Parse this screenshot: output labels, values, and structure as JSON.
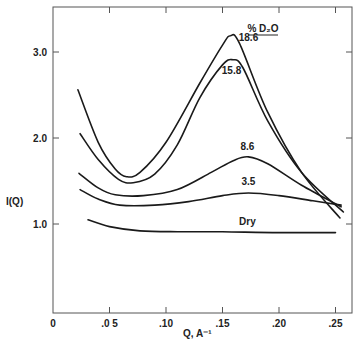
{
  "chart_data": {
    "type": "line",
    "title": "",
    "xlabel": "Q, A⁻¹",
    "ylabel": "I(Q)",
    "xlim": [
      0,
      0.265
    ],
    "ylim": [
      0,
      3.5
    ],
    "grid": false,
    "x_ticks": [
      {
        "value": 0,
        "label": "0"
      },
      {
        "value": 0.05,
        "label": ".0 5"
      },
      {
        "value": 0.1,
        "label": ".10"
      },
      {
        "value": 0.15,
        "label": ".15"
      },
      {
        "value": 0.2,
        "label": ".20"
      },
      {
        "value": 0.25,
        "label": ".25"
      }
    ],
    "y_ticks": [
      {
        "value": 1.0,
        "label": "1.0"
      },
      {
        "value": 2.0,
        "label": "2.0"
      },
      {
        "value": 3.0,
        "label": "3.0"
      }
    ],
    "legend_header": "% D₂O",
    "series": [
      {
        "name": "18.6",
        "x": [
          0.022,
          0.04,
          0.055,
          0.065,
          0.077,
          0.1,
          0.13,
          0.15,
          0.157,
          0.165,
          0.19,
          0.22,
          0.254
        ],
        "y": [
          2.56,
          1.95,
          1.64,
          1.55,
          1.6,
          1.95,
          2.64,
          3.08,
          3.19,
          3.1,
          2.3,
          1.6,
          1.07
        ]
      },
      {
        "name": "15.8",
        "x": [
          0.024,
          0.04,
          0.058,
          0.071,
          0.09,
          0.11,
          0.13,
          0.15,
          0.159,
          0.168,
          0.19,
          0.22,
          0.257
        ],
        "y": [
          2.05,
          1.75,
          1.52,
          1.48,
          1.58,
          1.92,
          2.47,
          2.85,
          2.91,
          2.82,
          2.2,
          1.6,
          1.14
        ]
      },
      {
        "name": "8.6",
        "x": [
          0.023,
          0.04,
          0.055,
          0.08,
          0.11,
          0.14,
          0.16,
          0.173,
          0.19,
          0.22,
          0.255
        ],
        "y": [
          1.59,
          1.42,
          1.34,
          1.33,
          1.4,
          1.6,
          1.74,
          1.78,
          1.7,
          1.45,
          1.2
        ]
      },
      {
        "name": "3.5",
        "x": [
          0.024,
          0.04,
          0.059,
          0.09,
          0.12,
          0.15,
          0.173,
          0.2,
          0.23,
          0.255
        ],
        "y": [
          1.4,
          1.29,
          1.22,
          1.22,
          1.26,
          1.33,
          1.36,
          1.33,
          1.27,
          1.22
        ]
      },
      {
        "name": "Dry",
        "x": [
          0.031,
          0.05,
          0.077,
          0.11,
          0.15,
          0.2,
          0.25
        ],
        "y": [
          1.05,
          0.97,
          0.92,
          0.91,
          0.91,
          0.9,
          0.9
        ]
      }
    ],
    "curve_labels": [
      {
        "text": "18.6",
        "x": 0.173,
        "y": 3.13
      },
      {
        "text": "15.8",
        "x": 0.158,
        "y": 2.75
      },
      {
        "text": "8.6",
        "x": 0.172,
        "y": 1.86
      },
      {
        "text": "3.5",
        "x": 0.173,
        "y": 1.45
      },
      {
        "text": "Dry",
        "x": 0.172,
        "y": 0.99
      }
    ],
    "colors": {
      "line": "#1a1a1a",
      "axis": "#555555",
      "text": "#222222"
    }
  }
}
